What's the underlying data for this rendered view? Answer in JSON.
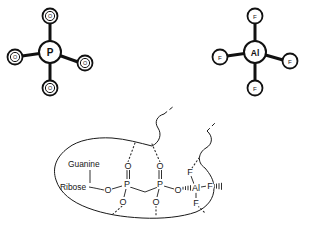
{
  "figure": {
    "background_color": "#ffffff",
    "line_color": "#111111",
    "panels": [
      {
        "id": "phosphate",
        "name": "phosphate-group",
        "center_atom": "P",
        "ligands": [
          "O",
          "O",
          "O",
          "O"
        ],
        "geometry": "tetrahedral-2d-cross"
      },
      {
        "id": "aluminum-fluoride",
        "name": "aluminium-tetrafluoride-group",
        "center_atom": "Al",
        "ligands": [
          "F",
          "F",
          "F",
          "F"
        ],
        "geometry": "tetrahedral-2d-cross"
      }
    ],
    "binding_site": {
      "name": "active-site-pocket",
      "labels": {
        "guanine": "Guanine",
        "ribose": "Ribose"
      },
      "chain_atoms": {
        "p_left": "P",
        "p_right": "P",
        "al": "Al",
        "o_bridge_left": "O",
        "o_bridge_right": "O",
        "o_top_left": "O",
        "o_top_right": "O",
        "o_bottom_left": "O",
        "o_bottom_right": "O",
        "f_top": "F",
        "f_right": "F",
        "f_bottom": "F"
      }
    }
  },
  "top_left_group": {
    "center": "P",
    "ligand_top": "O",
    "ligand_left": "O",
    "ligand_right": "O",
    "ligand_bottom": "O"
  },
  "top_right_group": {
    "center": "Al",
    "ligand_top": "F",
    "ligand_left": "F",
    "ligand_right": "F",
    "ligand_bottom": "F"
  },
  "pocket": {
    "guanine_label": "Guanine",
    "ribose_label": "Ribose",
    "p_left": "P",
    "p_right": "P",
    "al": "Al",
    "o_ester_left": "O",
    "o_ester_right": "O",
    "o_axial_tl": "O",
    "o_axial_tr": "O",
    "o_axial_bl": "O",
    "o_axial_br": "O",
    "f_upper": "F",
    "f_side": "F",
    "f_lower": "F"
  }
}
